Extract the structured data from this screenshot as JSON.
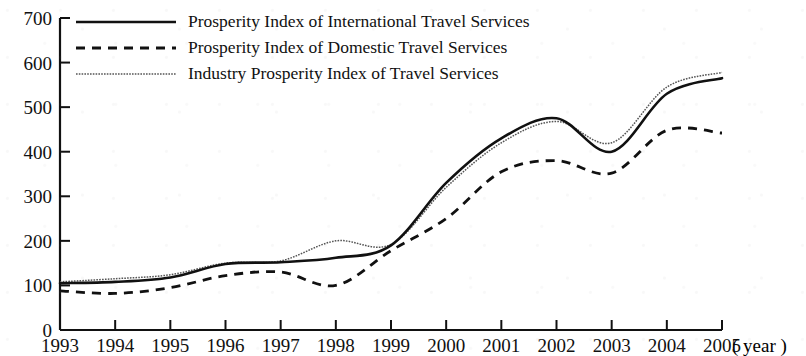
{
  "chart_data": {
    "type": "line",
    "title": "",
    "xlabel": "( year )",
    "ylabel": "",
    "xlim": [
      1993,
      2005
    ],
    "ylim": [
      0,
      700
    ],
    "grid": false,
    "legend_position": "top-left",
    "x": [
      1993,
      1994,
      1995,
      1996,
      1997,
      1998,
      1999,
      2000,
      2001,
      2002,
      2003,
      2004,
      2005
    ],
    "x_tick_labels": [
      "1993",
      "1994",
      "1995",
      "1996",
      "1997",
      "1998",
      "1999",
      "2000",
      "2001",
      "2002",
      "2003",
      "2004",
      "2005"
    ],
    "y_tick_labels": [
      "0",
      "100",
      "200",
      "300",
      "400",
      "500",
      "600",
      "700"
    ],
    "y_ticks": [
      0,
      100,
      200,
      300,
      400,
      500,
      600,
      700
    ],
    "series": [
      {
        "name": "Prosperity Index of International Travel Services",
        "style": "solid",
        "color": "#111111",
        "values": [
          105,
          108,
          118,
          148,
          152,
          162,
          190,
          330,
          430,
          475,
          400,
          530,
          565
        ]
      },
      {
        "name": "Prosperity Index of Domestic Travel Services",
        "style": "dashed",
        "color": "#111111",
        "values": [
          88,
          82,
          95,
          122,
          130,
          100,
          178,
          250,
          355,
          380,
          352,
          448,
          442
        ]
      },
      {
        "name": "Industry Prosperity Index of Travel Services",
        "style": "dotted",
        "color": "#555555",
        "values": [
          108,
          115,
          124,
          150,
          155,
          200,
          192,
          320,
          420,
          468,
          420,
          545,
          578
        ]
      }
    ]
  },
  "legend": {
    "items": [
      {
        "label": "Prosperity Index of International Travel Services",
        "style": "solid"
      },
      {
        "label": "Prosperity Index of Domestic Travel Services",
        "style": "dashed"
      },
      {
        "label": "Industry Prosperity Index of Travel Services",
        "style": "dotted"
      }
    ]
  },
  "axis": {
    "x_unit_label": "( year )"
  }
}
